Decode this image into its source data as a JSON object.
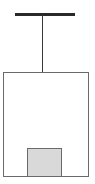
{
  "diagram": {
    "type": "suspended-box-schematic",
    "elements": [
      {
        "name": "ceiling-bar",
        "shape": "horizontal-bar",
        "color": "#2a2a2a"
      },
      {
        "name": "suspension-line",
        "shape": "vertical-line",
        "color": "#3a3a3a"
      },
      {
        "name": "outer-box",
        "shape": "rectangle",
        "border_color": "#6a6a6a",
        "fill": "#ffffff"
      },
      {
        "name": "inner-block",
        "shape": "square",
        "border_color": "#6a6a6a",
        "fill": "#d9d9d9"
      }
    ],
    "labels": []
  }
}
